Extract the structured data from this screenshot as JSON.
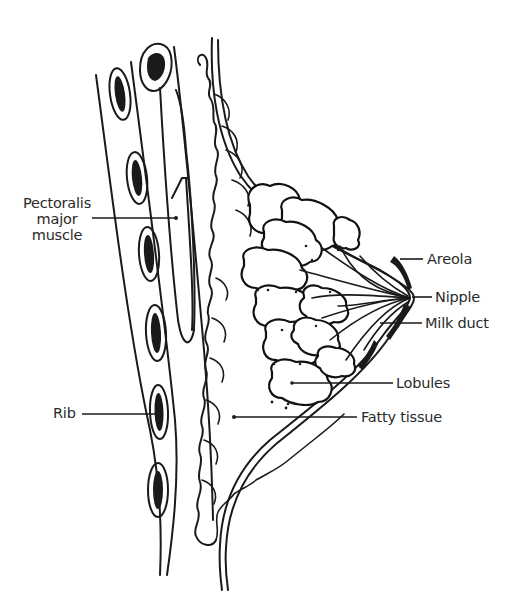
{
  "diagram": {
    "labels": {
      "pectoralis_major_muscle": [
        "Pectoralis",
        "major",
        "muscle"
      ],
      "rib": "Rib",
      "areola": "Areola",
      "nipple": "Nipple",
      "milk_duct": "Milk duct",
      "lobules": "Lobules",
      "fatty_tissue": "Fatty tissue"
    },
    "colors": {
      "line": "#1a1a1a",
      "background": "#ffffff",
      "text": "#2a2a2a"
    }
  }
}
